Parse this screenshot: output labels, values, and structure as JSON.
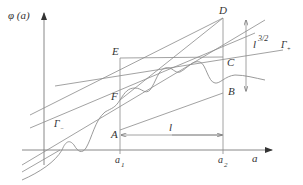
{
  "axes": {
    "y_label": "φ (a)",
    "x_label": "a"
  },
  "ticks": {
    "a1": {
      "base": "a",
      "sub": "1"
    },
    "a2": {
      "base": "a",
      "sub": "2"
    }
  },
  "points": {
    "D": "D",
    "E": "E",
    "C": "C",
    "F": "F",
    "A": "A",
    "B": "B"
  },
  "labels": {
    "length": "l",
    "scale_base": "l",
    "scale_exp": "3/2",
    "gamma_plus_base": "Γ",
    "gamma_plus_sub": "+",
    "gamma_minus_base": "Γ",
    "gamma_minus_sub": "−"
  },
  "colors": {
    "line": "#8a8a8a",
    "text": "#333333",
    "background": "#ffffff"
  }
}
